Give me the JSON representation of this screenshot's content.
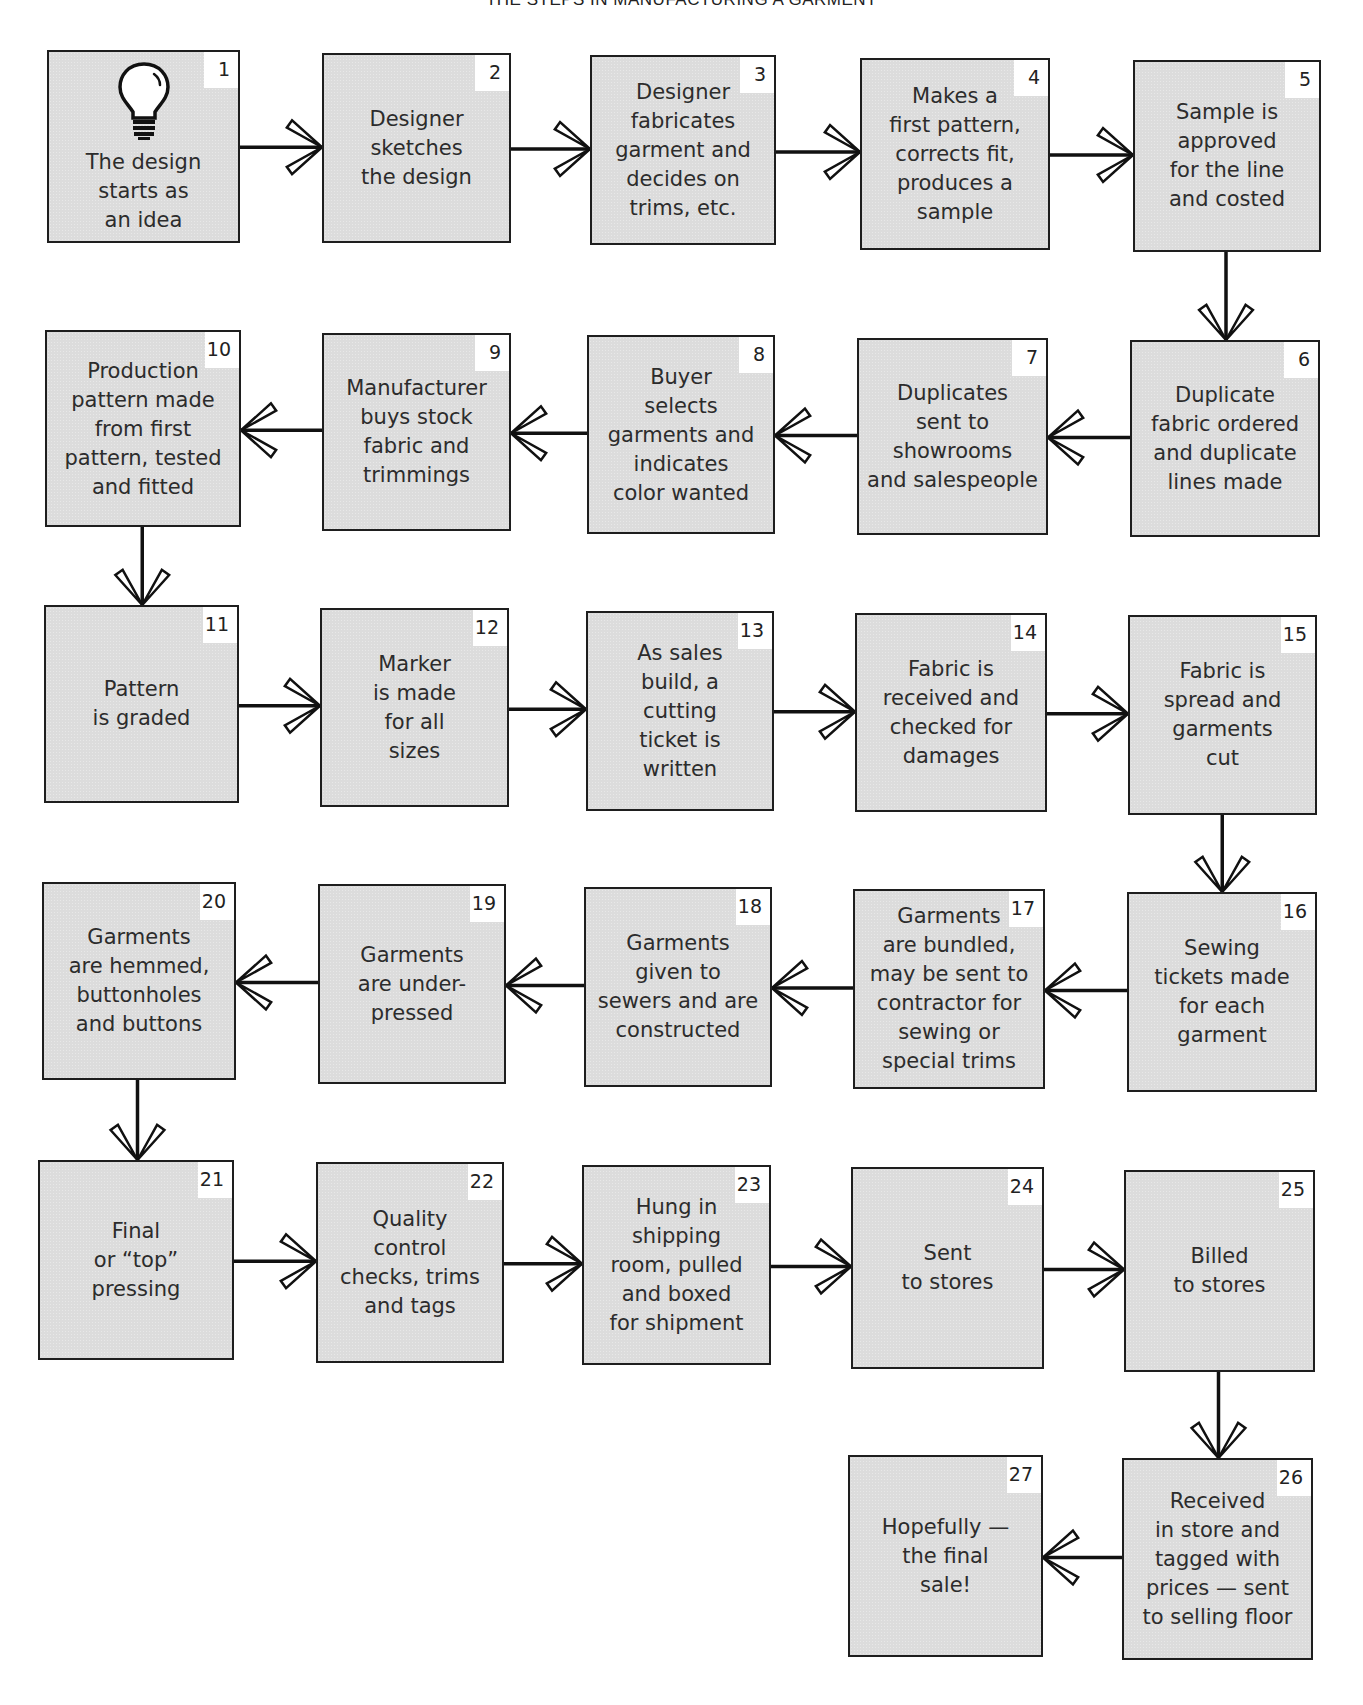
{
  "title": "The steps in manufacturing a garment",
  "steps": [
    {
      "number": "1",
      "text": "The design\nstarts as\nan idea",
      "icon": "lightbulb-icon"
    },
    {
      "number": "2",
      "text": "Designer\nsketches\nthe design"
    },
    {
      "number": "3",
      "text": "Designer\nfabricates\ngarment and\ndecides on\ntrims, etc."
    },
    {
      "number": "4",
      "text": "Makes a\nfirst pattern,\ncorrects fit,\nproduces a\nsample"
    },
    {
      "number": "5",
      "text": "Sample is\napproved\nfor the line\nand costed"
    },
    {
      "number": "6",
      "text": "Duplicate\nfabric ordered\nand duplicate\nlines made"
    },
    {
      "number": "7",
      "text": "Duplicates\nsent to\nshowrooms\nand salespeople"
    },
    {
      "number": "8",
      "text": "Buyer\nselects\ngarments and\nindicates\ncolor wanted"
    },
    {
      "number": "9",
      "text": "Manufacturer\nbuys stock\nfabric and\ntrimmings"
    },
    {
      "number": "10",
      "text": "Production\npattern made\nfrom first\npattern, tested\nand fitted"
    },
    {
      "number": "11",
      "text": "Pattern\nis graded"
    },
    {
      "number": "12",
      "text": "Marker\nis made\nfor all\nsizes"
    },
    {
      "number": "13",
      "text": "As sales\nbuild, a\ncutting\nticket is\nwritten"
    },
    {
      "number": "14",
      "text": "Fabric is\nreceived and\nchecked for\ndamages"
    },
    {
      "number": "15",
      "text": "Fabric is\nspread and\ngarments\ncut"
    },
    {
      "number": "16",
      "text": "Sewing\ntickets made\nfor each\ngarment"
    },
    {
      "number": "17",
      "text": "Garments\nare bundled,\nmay be sent to\ncontractor for\nsewing or\nspecial trims"
    },
    {
      "number": "18",
      "text": "Garments\ngiven to\nsewers and are\nconstructed"
    },
    {
      "number": "19",
      "text": "Garments\nare under-\npressed"
    },
    {
      "number": "20",
      "text": "Garments\nare hemmed,\nbuttonholes\nand buttons"
    },
    {
      "number": "21",
      "text": "Final\nor “top”\npressing"
    },
    {
      "number": "22",
      "text": "Quality\ncontrol\nchecks, trims\nand tags"
    },
    {
      "number": "23",
      "text": "Hung in\nshipping\nroom, pulled\nand boxed\nfor shipment"
    },
    {
      "number": "24",
      "text": "Sent\nto stores"
    },
    {
      "number": "25",
      "text": "Billed\nto stores"
    },
    {
      "number": "26",
      "text": "Received\nin store and\ntagged with\nprices — sent\nto selling floor"
    },
    {
      "number": "27",
      "text": "Hopefully —\nthe final\nsale!"
    }
  ],
  "flow": [
    [
      1,
      2
    ],
    [
      2,
      3
    ],
    [
      3,
      4
    ],
    [
      4,
      5
    ],
    [
      5,
      6
    ],
    [
      6,
      7
    ],
    [
      7,
      8
    ],
    [
      8,
      9
    ],
    [
      9,
      10
    ],
    [
      10,
      11
    ],
    [
      11,
      12
    ],
    [
      12,
      13
    ],
    [
      13,
      14
    ],
    [
      14,
      15
    ],
    [
      15,
      16
    ],
    [
      16,
      17
    ],
    [
      17,
      18
    ],
    [
      18,
      19
    ],
    [
      19,
      20
    ],
    [
      20,
      21
    ],
    [
      21,
      22
    ],
    [
      22,
      23
    ],
    [
      23,
      24
    ],
    [
      24,
      25
    ],
    [
      25,
      26
    ],
    [
      26,
      27
    ]
  ]
}
